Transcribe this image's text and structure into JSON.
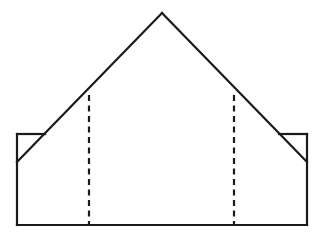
{
  "figure": {
    "background_color": "#ffffff",
    "stroke_color": "#1a1a1a",
    "fill_color": "#ffffff",
    "canvas": {
      "width": 324,
      "height": 246
    },
    "stroke_width": 2.2,
    "dash_pattern": "6 4.5"
  },
  "geometry": {
    "apex": {
      "x": 162,
      "y": 13
    },
    "rectangle": {
      "left": 17,
      "right": 307,
      "top": 134,
      "bottom": 225
    },
    "diagonals": {
      "left": {
        "x1": 162,
        "y1": 13,
        "x2": 17,
        "y2": 162
      },
      "right": {
        "x1": 162,
        "y1": 13,
        "x2": 307,
        "y2": 162
      }
    },
    "fold_lines": [
      {
        "name": "left-fold",
        "x": 89,
        "y_top": 95,
        "y_bottom": 225
      },
      {
        "name": "right-fold",
        "x": 234,
        "y_top": 95,
        "y_bottom": 225
      }
    ],
    "corner_notches": [
      {
        "name": "left-notch",
        "top": 134,
        "bottom": 162,
        "outer_x": 17,
        "inner_x": 45
      },
      {
        "name": "right-notch",
        "top": 134,
        "bottom": 162,
        "outer_x": 307,
        "inner_x": 279
      }
    ]
  },
  "paths": {
    "outline": "M 17 134 L 17 225 L 307 225 L 307 134 L 279 134 L 162 13 L 45 134 Z",
    "left_roof_diagonal": "M 162 13 L 17 162",
    "right_roof_diagonal": "M 162 13 L 307 162",
    "rect_top_left_segment": "M 17 134 L 45 134",
    "rect_top_right_segment": "M 279 134 L 307 134",
    "rect_left_edge": "M 17 134 L 17 225",
    "rect_right_edge": "M 307 134 L 307 225",
    "rect_bottom_edge": "M 17 225 L 307 225",
    "left_fold": "M 89 95 L 89 225",
    "right_fold": "M 234 95 L 234 225"
  }
}
